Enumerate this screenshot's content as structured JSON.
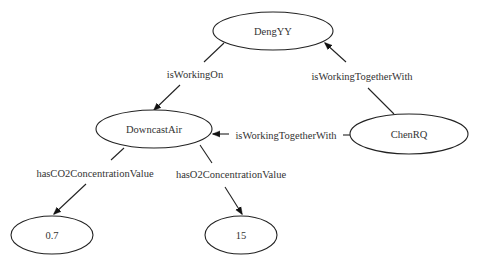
{
  "diagram": {
    "type": "knowledge-graph",
    "nodes": [
      {
        "id": "dengyy",
        "label": "DengYY"
      },
      {
        "id": "downcastair",
        "label": "DowncastAir"
      },
      {
        "id": "chenrq",
        "label": "ChenRQ"
      },
      {
        "id": "val_co2",
        "label": "0.7"
      },
      {
        "id": "val_o2",
        "label": "15"
      }
    ],
    "edges": [
      {
        "from": "DengYY",
        "to": "DowncastAir",
        "label": "isWorkingOn"
      },
      {
        "from": "ChenRQ",
        "to": "DengYY",
        "label": "isWorkingTogetherWith"
      },
      {
        "from": "ChenRQ",
        "to": "DowncastAir",
        "label": "isWorkingTogetherWith"
      },
      {
        "from": "DowncastAir",
        "to": "0.7",
        "label": "hasCO2ConcentrationValue"
      },
      {
        "from": "DowncastAir",
        "to": "15",
        "label": "hasO2ConcentrationValue"
      }
    ]
  }
}
